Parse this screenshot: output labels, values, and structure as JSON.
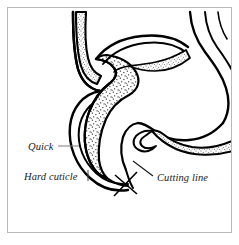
{
  "figure": {
    "frame": {
      "border_color": "#b9b9b9",
      "background_color": "#ffffff",
      "inset_px": 7
    },
    "ink_color": "#000000",
    "stipple_color": "#000000",
    "leader_color": "#7d7d7d",
    "labels": [
      {
        "id": "quick",
        "text": "Quick",
        "x": 28,
        "y": 150,
        "leader": {
          "type": "horizontal-line",
          "from_x": 58,
          "from_y": 146,
          "to_x": 79,
          "to_y": 146
        }
      },
      {
        "id": "hard-cuticle",
        "text": "Hard cuticle",
        "x": 24,
        "y": 180,
        "leader": {
          "type": "vertical-tick",
          "from_x": 88,
          "from_y": 170,
          "to_x": 88,
          "to_y": 181
        }
      },
      {
        "id": "cutting-line",
        "text": "Cutting line",
        "x": 157,
        "y": 181,
        "leader": {
          "type": "diagonal-line",
          "from_x": 153,
          "from_y": 176,
          "to_x": 133,
          "to_y": 161
        }
      }
    ],
    "markers": [
      {
        "id": "cut-mark",
        "type": "cross",
        "center_x": 126,
        "center_y": 184,
        "note": "X mark indicating where to cut the claw"
      }
    ],
    "regions": [
      {
        "id": "quick-region",
        "name": "Quick",
        "fill": "stipple"
      },
      {
        "id": "cuticle-region",
        "name": "Hard cuticle",
        "fill": "outline"
      },
      {
        "id": "nail-bed-strip",
        "name": "Nail bed strip",
        "fill": "stipple"
      },
      {
        "id": "toe-pad-right",
        "name": "Adjacent toe",
        "fill": "outline"
      }
    ]
  }
}
